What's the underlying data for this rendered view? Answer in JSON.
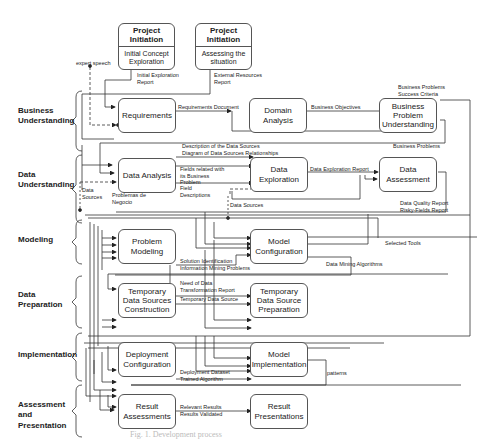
{
  "phases": [
    {
      "label": "Business Understanding"
    },
    {
      "label": "Data Understanding"
    },
    {
      "label": "Modeling"
    },
    {
      "label": "Data Preparation"
    },
    {
      "label": "Implementation"
    },
    {
      "label": "Assessment and Presentation"
    }
  ],
  "project_initiation": [
    {
      "title": "Project Initiation",
      "body": "Initial Concept Exploration",
      "output": "Initial Exploration Report"
    },
    {
      "title": "Project Initiation",
      "body": "Assessing the situation",
      "output": "External Resources Report"
    }
  ],
  "boxes": {
    "requirements": "Requirements",
    "domain_analysis": "Domain Analysis",
    "business_problem_understanding": "Business Problem Understanding",
    "data_analysis": "Data Analysis",
    "data_exploration": "Data Exploration",
    "data_assessment": "Data Assessment",
    "problem_modeling": "Problem Modeling",
    "model_configuration": "Model Configuration",
    "temporary_data_sources_construction": "Temporary Data Sources Construction",
    "temporary_data_source_preparation": "Temporary Data Source Preparation",
    "deployment_configuration": "Deployment Configuration",
    "model_implementation": "Model Implementation",
    "result_assessments": "Result Assessments",
    "result_presentations": "Result Presentations"
  },
  "flow_labels": {
    "expert_speech": "expert speech",
    "requirements_document": "Requirements Document",
    "business_objectives": "Business Objectives",
    "business_problems_success_criteria": "Business Problems Success Criteria",
    "business_problems": "Business Problems",
    "description_data_sources": "Description of the Data Sources",
    "diagram_data_sources": "Diagram of Data Sources Relationships",
    "fields_related": "Fields related with its Business Problem",
    "field_descriptions": "Field Descriptions",
    "data_sources_left": "Data Sources",
    "problemas_negocio": "Problemas de Negocio",
    "data_sources_mid": "Data Sources",
    "data_exploration_report": "Data Exploration Report",
    "data_quality_report": "Data Quality Report",
    "risky_fields_report": "Risky-Fields Report",
    "selected_tools": "Selected Tools",
    "solution_identification": "Solution Identification",
    "information_mining_problems": "Information Mining Problems",
    "data_mining_algorithms": "Data Mining Algorithms",
    "need_transformation_report": "Need of Data Transformation Report",
    "temporary_data_source": "Temporary Data Source",
    "deployment_dataset": "Deployment Dataset",
    "trained_algorithm": "Trained Algorithm",
    "patterns": "patterns",
    "relevant_results": "Relevant Results",
    "results_validated": "Results Validated"
  },
  "caption": "Fig. 1. Development process"
}
